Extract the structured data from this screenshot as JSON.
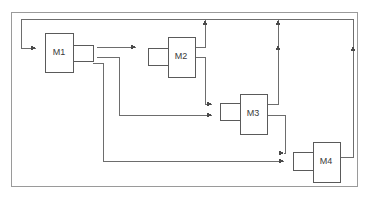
{
  "diagram": {
    "type": "block-flow-diagram",
    "canvas": {
      "width": 368,
      "height": 198,
      "background": "#ffffff"
    },
    "colors": {
      "stroke": "#6d6d6d",
      "box_stroke": "#5a5a5a",
      "box_fill": "#ffffff",
      "label": "#3a3a3a",
      "frame": "#9a9a9a",
      "arrow": "#4a4a4a"
    },
    "frame": {
      "x": 11,
      "y": 12,
      "width": 346,
      "height": 174
    },
    "blocks": [
      {
        "id": "M1",
        "label": "M1",
        "main": {
          "x": 45,
          "y": 33,
          "width": 28,
          "height": 39
        },
        "port": {
          "x": 73,
          "y": 45,
          "width": 20,
          "height": 16,
          "side": "right"
        },
        "label_x": 59,
        "label_y": 53
      },
      {
        "id": "M2",
        "label": "M2",
        "main": {
          "x": 168,
          "y": 37,
          "width": 27,
          "height": 40
        },
        "port": {
          "x": 148,
          "y": 48,
          "width": 20,
          "height": 17,
          "side": "left"
        },
        "label_x": 181,
        "label_y": 57
      },
      {
        "id": "M3",
        "label": "M3",
        "main": {
          "x": 240,
          "y": 94,
          "width": 27,
          "height": 40
        },
        "port": {
          "x": 220,
          "y": 103,
          "width": 20,
          "height": 17,
          "side": "left"
        },
        "label_x": 253,
        "label_y": 114
      },
      {
        "id": "M4",
        "label": "M4",
        "main": {
          "x": 313,
          "y": 142,
          "width": 27,
          "height": 40
        },
        "port": {
          "x": 293,
          "y": 152,
          "width": 20,
          "height": 18,
          "side": "left"
        },
        "label_x": 326,
        "label_y": 162
      }
    ],
    "connectors": [
      {
        "name": "feedback-bus-to-m1",
        "path": "M 353 19 L 21 19 L 21 48 L 36 48",
        "arrow_at": [
          36,
          48
        ],
        "arrow_dir": "right"
      },
      {
        "name": "m1-to-m2",
        "path": "M 97 47 L 136 47",
        "arrow_at": [
          136,
          47
        ],
        "arrow_dir": "right"
      },
      {
        "name": "m2-out-up-to-bus",
        "path": "M 195 47 L 205 47 L 205 20",
        "arrow_at": [
          205,
          20
        ],
        "arrow_dir": "up"
      },
      {
        "name": "m2-out-down-to-m3",
        "path": "M 195 57 L 205 57 L 205 104 L 212 104",
        "arrow_at": [
          212,
          104
        ],
        "arrow_dir": "right"
      },
      {
        "name": "m1-branch-to-m3",
        "path": "M 97 57 L 119 57 L 119 115 L 212 115",
        "arrow_at": [
          212,
          115
        ],
        "arrow_dir": "right"
      },
      {
        "name": "m1-branch-to-m4",
        "path": "M 93 63 L 103 63 L 103 161 L 284 161",
        "arrow_at": [
          284,
          161
        ],
        "arrow_dir": "right"
      },
      {
        "name": "m3-out-up-to-bus",
        "path": "M 267 104 L 278 104 L 278 20",
        "arrow_at": [
          278,
          20
        ],
        "arrow_dir": "up",
        "mid_arrow": [
          278,
          45
        ]
      },
      {
        "name": "m3-out-down-to-m4",
        "path": "M 267 115 L 285 115 L 285 153 L 284 153",
        "arrow_at": [
          284,
          153
        ],
        "arrow_dir": "right"
      },
      {
        "name": "m4-out-up-to-bus",
        "path": "M 340 157 L 353 157 L 353 19",
        "arrow_at": [
          353,
          46
        ],
        "arrow_dir": "up"
      }
    ]
  }
}
